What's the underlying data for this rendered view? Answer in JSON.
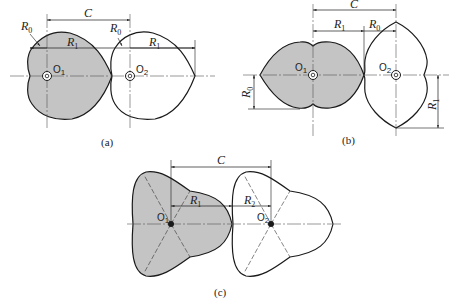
{
  "colors": {
    "rotor_fill": "#c4c4c4",
    "outline": "#1a1a1a",
    "centerline": "#555555",
    "background": "#ffffff"
  },
  "figures": [
    {
      "caption": "(a)",
      "shape": "cardioid (heart-shaped) rotor pair",
      "labels": {
        "center_distance": "C",
        "r0_left": "R",
        "r0_left_sub": "0",
        "r1_left": "R",
        "r1_left_sub": "1",
        "r0_right": "R",
        "r0_right_sub": "0",
        "r1_right": "R",
        "r1_right_sub": "1",
        "center1": "O",
        "center1_sub": "1",
        "center2": "O",
        "center2_sub": "2"
      }
    },
    {
      "caption": "(b)",
      "shape": "two-lobe lens rotor pair",
      "labels": {
        "center_distance": "C",
        "r1_top": "R",
        "r1_top_sub": "1",
        "r0_top": "R",
        "r0_top_sub": "0",
        "r0_side": "R",
        "r0_side_sub": "0",
        "r1_side": "R",
        "r1_side_sub": "1",
        "center1": "O",
        "center1_sub": "1",
        "center2": "O",
        "center2_sub": "2"
      }
    },
    {
      "caption": "(c)",
      "shape": "three-lobe rotor pair",
      "labels": {
        "center_distance": "C",
        "r1": "R",
        "r1_sub": "1",
        "r2": "R",
        "r2_sub": "2",
        "center1": "O",
        "center1_sub": "1",
        "center2": "O",
        "center2_sub": "2"
      }
    }
  ]
}
